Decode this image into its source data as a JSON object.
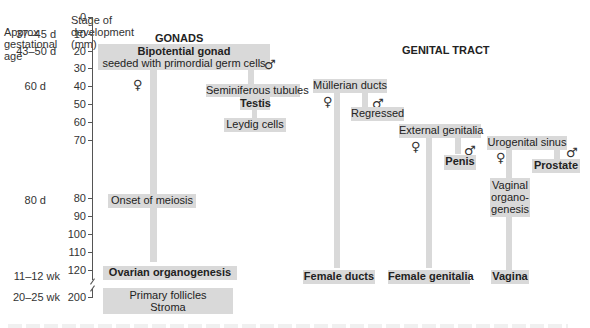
{
  "axis": {
    "age_header": [
      "Approx",
      "gestational",
      "age"
    ],
    "stage_header": [
      "Stage of",
      "development",
      "(mm)"
    ],
    "ticks": [
      "0",
      "10",
      "20",
      "30",
      "40",
      "50",
      "60",
      "70",
      "80",
      "90",
      "100",
      "110",
      "120",
      "200"
    ],
    "ages": [
      {
        "label": "37–45 d",
        "at": "10"
      },
      {
        "label": "43–50 d",
        "at": "20"
      },
      {
        "label": "60 d",
        "at": "40"
      },
      {
        "label": "80 d",
        "at": "80"
      },
      {
        "label": "11–12 wk",
        "at": "120"
      },
      {
        "label": "20–25 wk",
        "at": "200"
      }
    ]
  },
  "gonads": {
    "title": "GONADS",
    "bipotential": {
      "line1": "Bipotential gonad",
      "line2": "seeded with primordial germ cells"
    },
    "female_symbol": "♀",
    "male_symbol": "♂",
    "seminiferous": "Seminiferous tubules",
    "testis": "Testis",
    "leydig": "Leydig cells",
    "meiosis": "Onset of meiosis",
    "ovarian": "Ovarian organogenesis",
    "follicles": {
      "line1": "Primary follicles",
      "line2": "Stroma"
    }
  },
  "genital_tract": {
    "title": "GENITAL TRACT",
    "mullerian": "Müllerian ducts",
    "regressed": "Regressed",
    "female_ducts": "Female ducts",
    "external": "External genitalia",
    "penis": "Penis",
    "female_genitalia": "Female genitalia",
    "urogenital": "Urogenital sinus",
    "prostate": "Prostate",
    "vaginal_org": [
      "Vaginal",
      "organo-",
      "genesis"
    ],
    "vagina": "Vagina",
    "female_symbol": "♀",
    "male_symbol": "♂"
  }
}
